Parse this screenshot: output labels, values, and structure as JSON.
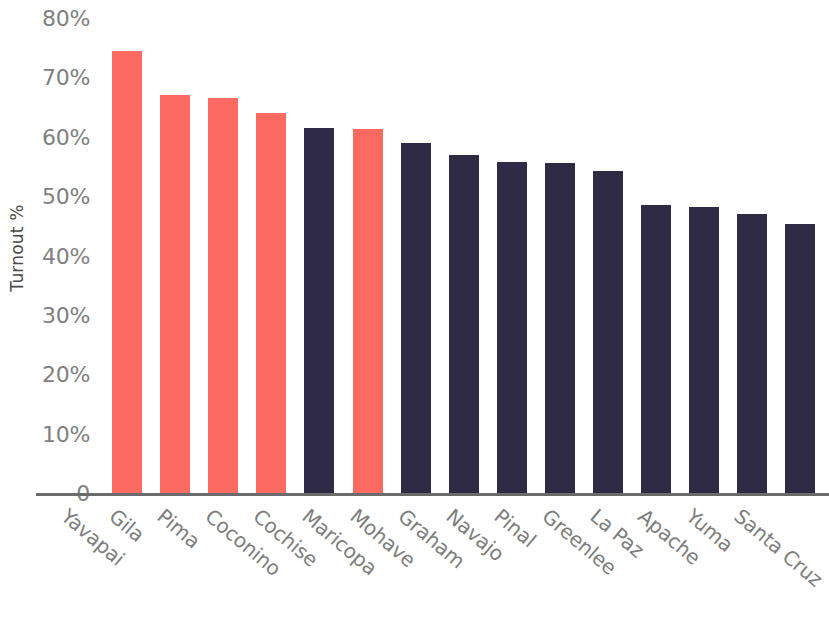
{
  "chart_data": {
    "type": "bar",
    "title": "",
    "subtitle": "",
    "xlabel": "",
    "ylabel": "Turnout %",
    "ylim": [
      0,
      80
    ],
    "grid": false,
    "legend": null,
    "y_ticks": [
      "80%",
      "70%",
      "60%",
      "50%",
      "40%",
      "30%",
      "20%",
      "10%",
      "0"
    ],
    "y_tick_values": [
      80,
      70,
      60,
      50,
      40,
      30,
      20,
      10,
      0
    ],
    "categories": [
      "Yavapai",
      "Gila",
      "Pima",
      "Coconino",
      "Cochise",
      "Maricopa",
      "Mohave",
      "Graham",
      "Navajo",
      "Pinal",
      "Greenlee",
      "La Paz",
      "Apache",
      "Yuma",
      "Santa Cruz"
    ],
    "values": [
      74.5,
      67.0,
      66.5,
      64.0,
      61.5,
      61.3,
      59.0,
      57.0,
      55.8,
      55.5,
      54.2,
      48.5,
      48.2,
      47.0,
      45.3
    ],
    "bar_colors": [
      "#fb6a60",
      "#fb6a60",
      "#fb6a60",
      "#fb6a60",
      "#2f2b47",
      "#fb6a60",
      "#2f2b47",
      "#2f2b47",
      "#2f2b47",
      "#2f2b47",
      "#2f2b47",
      "#2f2b47",
      "#2f2b47",
      "#2f2b47",
      "#2f2b47"
    ],
    "colors": {
      "highlight": "#fb6a60",
      "base": "#2f2b47",
      "axis_line": "#6b6b6b",
      "tick_text": "#808080",
      "axis_title": "#4a4a4a",
      "background": "#ffffff"
    }
  }
}
